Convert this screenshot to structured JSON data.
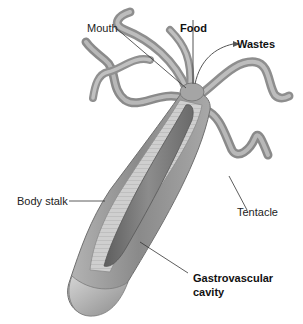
{
  "diagram": {
    "labels": {
      "mouth": "Mouth",
      "food": "Food",
      "wastes": "Wastes",
      "body_stalk": "Body stalk",
      "tentacle": "Tentacle",
      "gastro_line1": "Gastrovascular",
      "gastro_line2": "cavity"
    },
    "colors": {
      "body_outer": "#9a9a9a",
      "body_inner": "#6e6e6e",
      "tissue": "#c8c8c8",
      "leader_line": "#333333",
      "background": "#ffffff"
    }
  }
}
